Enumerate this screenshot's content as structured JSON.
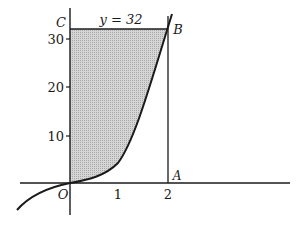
{
  "diagram": {
    "type": "area-under-curve",
    "curve": "y = 4x^3",
    "line_label": "y = 32",
    "points": {
      "C": "C",
      "B": "B",
      "A": "A",
      "O": "O"
    },
    "x_ticks": [
      "1",
      "2"
    ],
    "y_ticks": [
      "10",
      "20",
      "30"
    ],
    "colors": {
      "shade": "#bdbdbd",
      "line": "#1a1a1a"
    }
  }
}
